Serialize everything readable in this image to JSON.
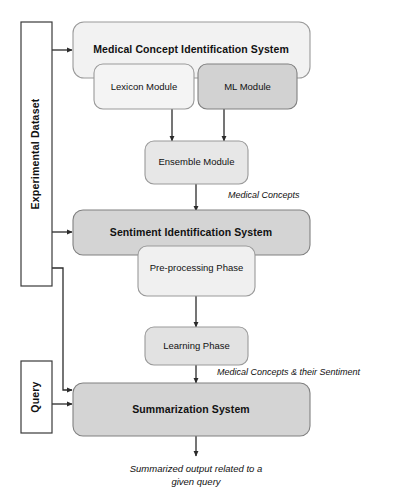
{
  "diagram": {
    "canvas": {
      "width": 396,
      "height": 499,
      "background": "#ffffff"
    },
    "colors": {
      "outer_system_fill": "#f2f2f2",
      "light_module_fill": "#f4f4f4",
      "mid_module_fill": "#e7e7e7",
      "dark_module_fill": "#d2d2d2",
      "system_fill": "#d4d4d4",
      "plain_box_fill": "#ffffff",
      "outline": "#9a9a9a",
      "plain_outline": "#3a3a3a",
      "connector": "#2b2b2b",
      "text": "#111111"
    },
    "input_boxes": [
      {
        "id": "experimental-dataset",
        "label": "Experimental Dataset",
        "orientation": "vertical"
      },
      {
        "id": "query",
        "label": "Query",
        "orientation": "vertical"
      }
    ],
    "systems": [
      {
        "id": "medical-concept-identification-system",
        "label": "Medical Concept Identification System",
        "emphasis": "bold",
        "fill": "#f2f2f2"
      },
      {
        "id": "sentiment-identification-system",
        "label": "Sentiment Identification System",
        "emphasis": "bold",
        "fill": "#d4d4d4"
      },
      {
        "id": "summarization-system",
        "label": "Summarization System",
        "emphasis": "bold",
        "fill": "#d4d4d4"
      }
    ],
    "modules": [
      {
        "id": "lexicon-module",
        "label": "Lexicon Module",
        "fill": "#f4f4f4"
      },
      {
        "id": "ml-module",
        "label": "ML Module",
        "fill": "#d2d2d2"
      },
      {
        "id": "ensemble-module",
        "label": "Ensemble Module",
        "fill": "#e7e7e7"
      },
      {
        "id": "pre-processing-phase",
        "label": "Pre-processing Phase",
        "fill": "#f0f0f0"
      },
      {
        "id": "learning-phase",
        "label": "Learning Phase",
        "fill": "#e2e2e2"
      }
    ],
    "edge_labels": [
      {
        "id": "medical-concepts",
        "label": "Medical Concepts"
      },
      {
        "id": "medical-concepts-and-sentiment",
        "label": "Medical Concepts & their Sentiment"
      }
    ],
    "output_caption": {
      "id": "summarized-output-caption",
      "line1": "Summarized output related to a",
      "line2": "given query"
    },
    "flows": [
      {
        "from": "experimental-dataset",
        "to": "medical-concept-identification-system"
      },
      {
        "from": "experimental-dataset",
        "to": "sentiment-identification-system"
      },
      {
        "from": "experimental-dataset",
        "to": "summarization-system"
      },
      {
        "from": "lexicon-module",
        "to": "ensemble-module"
      },
      {
        "from": "ml-module",
        "to": "ensemble-module"
      },
      {
        "from": "ensemble-module",
        "to": "sentiment-identification-system",
        "label": "Medical Concepts"
      },
      {
        "from": "pre-processing-phase",
        "to": "learning-phase"
      },
      {
        "from": "learning-phase",
        "to": "summarization-system",
        "label": "Medical Concepts & their Sentiment"
      },
      {
        "from": "query",
        "to": "summarization-system"
      },
      {
        "from": "summarization-system",
        "to": "summarized-output-caption"
      }
    ]
  }
}
